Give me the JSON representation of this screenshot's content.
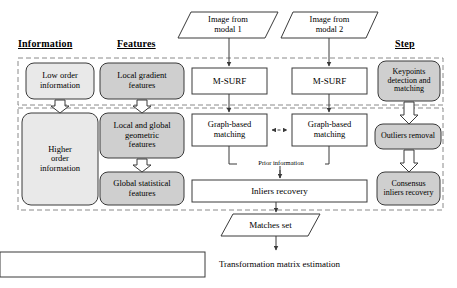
{
  "figure": {
    "colors": {
      "fill_gray": "#cfcfcf",
      "fill_light": "#e9e9e9",
      "fill_white": "#ffffff",
      "stroke": "#3a3a3a",
      "dashed_band": "#8a8a8a"
    }
  },
  "columns": [
    {
      "id": "information",
      "label": "Information"
    },
    {
      "id": "features",
      "label": "Features"
    },
    {
      "id": "step",
      "label": "Step"
    }
  ],
  "inputs": [
    {
      "id": "modal1",
      "label": "Image from\nmodal 1",
      "shape": "parallelogram"
    },
    {
      "id": "modal2",
      "label": "Image from\nmodal 2",
      "shape": "parallelogram"
    }
  ],
  "information_column": [
    {
      "id": "low-order-information",
      "label": "Low order\ninformation",
      "fill": "light"
    },
    {
      "id": "higher-order-information",
      "label": "Higher\norder\ninformation",
      "fill": "light"
    }
  ],
  "features_column": [
    {
      "id": "local-gradient-features",
      "label": "Local gradient\nfeatures",
      "fill": "gray"
    },
    {
      "id": "local-and-global-geometric",
      "label": "Local and global\ngeometric\nfeatures",
      "fill": "gray"
    },
    {
      "id": "global-statistical-features",
      "label": "Global statistical\nfeatures",
      "fill": "gray"
    }
  ],
  "pipeline_column": [
    {
      "id": "m-surf-left",
      "label": "M-SURF",
      "shape": "rect",
      "fill": "white"
    },
    {
      "id": "m-surf-right",
      "label": "M-SURF",
      "shape": "rect",
      "fill": "white"
    },
    {
      "id": "graph-based-matching-left",
      "label": "Graph-based\nmatching",
      "shape": "rect",
      "fill": "white"
    },
    {
      "id": "graph-based-matching-right",
      "label": "Graph-based\nmatching",
      "shape": "rect",
      "fill": "white"
    },
    {
      "id": "inliers-recovery",
      "label": "Inliers recovery",
      "shape": "rect",
      "fill": "white"
    },
    {
      "id": "matches-set",
      "label": "Matches set",
      "shape": "parallelogram",
      "fill": "white"
    },
    {
      "id": "transformation-matrix",
      "label": "Transformation matrix estimation",
      "shape": "rect",
      "fill": "white"
    }
  ],
  "step_column": [
    {
      "id": "keypoints-detection-and-matching",
      "label": "Keypoints\ndetection and\nmatching",
      "fill": "gray"
    },
    {
      "id": "outliers-removal",
      "label": "Outliers removal",
      "fill": "gray"
    },
    {
      "id": "consensus-inliers-recovery",
      "label": "Consensus\ninliers recovery",
      "fill": "gray"
    }
  ],
  "edge_labels": [
    {
      "id": "prior-information",
      "label": "Prior information"
    }
  ],
  "bands": [
    {
      "id": "band-upper",
      "rows": [
        "low-order-information",
        "local-gradient-features",
        "m-surf",
        "keypoints-detection-and-matching"
      ]
    },
    {
      "id": "band-lower",
      "rows": [
        "higher-order-information",
        "local-and-global-geometric",
        "global-statistical-features",
        "graph-based-matching",
        "inliers-recovery",
        "outliers-removal",
        "consensus-inliers-recovery"
      ]
    }
  ]
}
